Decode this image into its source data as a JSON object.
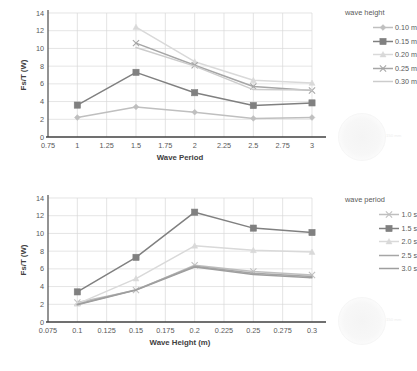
{
  "charts": [
    {
      "id": "chart-wave-period",
      "chart_data": {
        "type": "line",
        "title": "",
        "xlabel": "Wave Period",
        "ylabel": "Fs/T (W)",
        "xlim": [
          0.75,
          3.0
        ],
        "ylim": [
          0,
          14
        ],
        "xticks": [
          "0.75",
          "1",
          "1.25",
          "1.5",
          "1.75",
          "2",
          "2.25",
          "2.5",
          "2.75",
          "3"
        ],
        "xtick_values": [
          0.75,
          1,
          1.25,
          1.5,
          1.75,
          2,
          2.25,
          2.5,
          2.75,
          3
        ],
        "yticks": [
          "0",
          "2",
          "4",
          "6",
          "8",
          "10",
          "12",
          "14"
        ],
        "ytick_values": [
          0,
          2,
          4,
          6,
          8,
          10,
          12,
          14
        ],
        "grid": true,
        "legend_position": "right",
        "legend_title": "wave height",
        "x": [
          1,
          1.5,
          2,
          2.5,
          3
        ],
        "series": [
          {
            "name": "0.10 m",
            "values": [
              2.2,
              3.4,
              2.8,
              2.1,
              2.2
            ],
            "color": "#bfbfbf",
            "marker": "diamond"
          },
          {
            "name": "0.15 m",
            "values": [
              3.6,
              7.3,
              5.0,
              3.55,
              3.85
            ],
            "color": "#808080",
            "marker": "square"
          },
          {
            "name": "0.20 m",
            "values": [
              null,
              12.4,
              8.5,
              6.4,
              6.1
            ],
            "color": "#d9d9d9",
            "marker": "triangle"
          },
          {
            "name": "0.25 m",
            "values": [
              null,
              10.6,
              8.1,
              5.7,
              5.25
            ],
            "color": "#a6a6a6",
            "marker": "cross"
          },
          {
            "name": "0.30 m",
            "values": [
              null,
              10.1,
              8.0,
              5.35,
              5.3
            ],
            "color": "#cccccc",
            "marker": "none"
          }
        ]
      },
      "watermark": {
        "label": "150 mm"
      }
    },
    {
      "id": "chart-wave-height",
      "chart_data": {
        "type": "line",
        "title": "",
        "xlabel": "Wave Height (m)",
        "ylabel": "Fs/T (W)",
        "xlim": [
          0.075,
          0.3
        ],
        "ylim": [
          0,
          14
        ],
        "xticks": [
          "0.075",
          "0.1",
          "0.125",
          "0.15",
          "0.175",
          "0.2",
          "0.225",
          "0.25",
          "0.275",
          "0.3"
        ],
        "xtick_values": [
          0.075,
          0.1,
          0.125,
          0.15,
          0.175,
          0.2,
          0.225,
          0.25,
          0.275,
          0.3
        ],
        "yticks": [
          "0",
          "2",
          "4",
          "6",
          "8",
          "10",
          "12",
          "14"
        ],
        "ytick_values": [
          0,
          2,
          4,
          6,
          8,
          10,
          12,
          14
        ],
        "grid": true,
        "legend_position": "right",
        "legend_title": "wave period",
        "x": [
          0.1,
          0.15,
          0.2,
          0.25,
          0.3
        ],
        "series": [
          {
            "name": "1.0 s",
            "values": [
              2.2,
              3.6,
              6.4,
              5.7,
              5.3
            ],
            "color": "#bfbfbf",
            "marker": "cross"
          },
          {
            "name": "1.5 s",
            "values": [
              3.4,
              7.3,
              12.4,
              10.6,
              10.1
            ],
            "color": "#808080",
            "marker": "square"
          },
          {
            "name": "2.0 s",
            "values": [
              2.05,
              4.9,
              8.6,
              8.1,
              7.9
            ],
            "color": "#d9d9d9",
            "marker": "triangle"
          },
          {
            "name": "2.5 s",
            "values": [
              2.0,
              3.65,
              6.3,
              5.5,
              5.15
            ],
            "color": "#a6a6a6",
            "marker": "none"
          },
          {
            "name": "3.0 s",
            "values": [
              1.95,
              3.6,
              6.2,
              5.35,
              5.0
            ],
            "color": "#9e9e9e",
            "marker": "none"
          }
        ]
      },
      "watermark": {
        "label": "150 mm"
      }
    }
  ]
}
